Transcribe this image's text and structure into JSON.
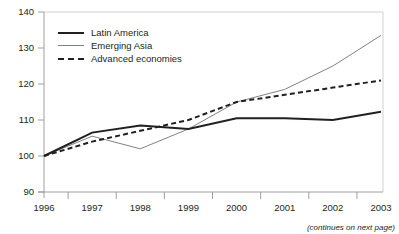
{
  "figure": {
    "title_partial": "",
    "footnote": "(continues on next page)"
  },
  "axes": {
    "y_ticks": [
      "140",
      "130",
      "120",
      "110",
      "100",
      "90"
    ],
    "x_ticks": [
      "1996",
      "1997",
      "1998",
      "1999",
      "2000",
      "2001",
      "2002",
      "2003"
    ]
  },
  "legend": {
    "items": [
      {
        "label": "Latin America",
        "style": "solid-thick",
        "color": "#231f20"
      },
      {
        "label": "Emerging Asia",
        "style": "solid-thin",
        "color": "#808285"
      },
      {
        "label": "Advanced economies",
        "style": "dashed",
        "color": "#231f20"
      }
    ]
  },
  "chart_data": {
    "type": "line",
    "title": "",
    "xlabel": "",
    "ylabel": "",
    "x": [
      1996,
      1997,
      1998,
      1999,
      2000,
      2001,
      2002,
      2003
    ],
    "xlim": [
      1996,
      2003
    ],
    "ylim": [
      90,
      140
    ],
    "ytick_step": 10,
    "grid": false,
    "legend_position": "top-left-inside",
    "series": [
      {
        "name": "Latin America",
        "color": "#231f20",
        "style": "solid",
        "width": 2.0,
        "values": [
          100,
          106.5,
          108.5,
          107.5,
          110.5,
          110.5,
          110,
          112.3
        ]
      },
      {
        "name": "Emerging Asia",
        "color": "#808285",
        "style": "solid",
        "width": 1.0,
        "values": [
          100,
          105.5,
          102,
          107.5,
          115,
          118.5,
          125,
          133.5
        ]
      },
      {
        "name": "Advanced economies",
        "color": "#231f20",
        "style": "dashed",
        "width": 2.0,
        "values": [
          100,
          104,
          107,
          110,
          115,
          117,
          119,
          121
        ]
      }
    ]
  }
}
